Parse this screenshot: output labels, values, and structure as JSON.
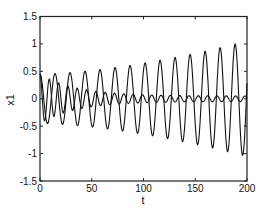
{
  "chart_data": {
    "type": "line",
    "title": "",
    "xlabel": "t",
    "ylabel": "x1",
    "xlim": [
      0,
      200
    ],
    "ylim": [
      -1.5,
      1.5
    ],
    "xticks": [
      0,
      50,
      100,
      150,
      200
    ],
    "xtick_labels": [
      "0",
      "50",
      "100",
      "150",
      "200"
    ],
    "yticks": [
      1.5,
      1,
      0.5,
      0,
      -0.5,
      -1,
      -1.5
    ],
    "ytick_labels": [
      "1.5",
      "1",
      "0.5",
      "0",
      "-0.5",
      "-1",
      "-1.5"
    ],
    "grid": false,
    "legend": null,
    "series": [
      {
        "name": "growing oscillation",
        "description": "sinusoid, period ~14.5, amplitude grows from ~0.45 at t=0 to ~1.05 at t=200",
        "period": 14.5,
        "amplitude_start": 0.45,
        "amplitude_end": 1.05,
        "phase": 0,
        "peaks": [
          {
            "t": 0,
            "y": 0.47
          },
          {
            "t": 15,
            "y": 0.45
          },
          {
            "t": 29,
            "y": 0.46
          },
          {
            "t": 43,
            "y": 0.47
          },
          {
            "t": 56,
            "y": 0.5
          },
          {
            "t": 71,
            "y": 0.52
          },
          {
            "t": 86,
            "y": 0.56
          },
          {
            "t": 100,
            "y": 0.62
          },
          {
            "t": 114,
            "y": 0.7
          },
          {
            "t": 129,
            "y": 0.78
          },
          {
            "t": 144,
            "y": 0.85
          },
          {
            "t": 158,
            "y": 0.92
          },
          {
            "t": 176,
            "y": 0.97
          },
          {
            "t": 193,
            "y": 1.08
          }
        ],
        "color": "#111111"
      },
      {
        "name": "decaying oscillation",
        "description": "sinusoid, period ~9, amplitude decays from ~0.45 at t=0 to ~0.05 by t~100 and stays small",
        "period": 9,
        "amplitude_start": 0.45,
        "amplitude_end": 0.05,
        "phase": 0,
        "color": "#111111"
      }
    ]
  }
}
